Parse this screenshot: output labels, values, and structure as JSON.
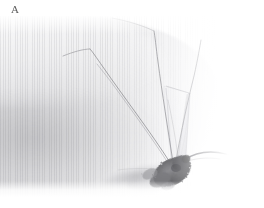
{
  "figure": {
    "panel_label": "A",
    "caption": "",
    "image_width": 264,
    "image_height": 208
  },
  "photo": {
    "alt": "Macro photograph of a mosquito resting on pale human skin",
    "background_color": "#ffffff",
    "skin_highlight_color": "#fbfbfc",
    "skin_midtone_color": "#e3e3e5",
    "skin_shadow_color": "#c4c4c6",
    "insect_body_color": "#6f6f71",
    "insect_leg_color": "#8a8a8e",
    "wing_color": "#dcdce0",
    "shadow_color": "#b9b9bd"
  },
  "anatomy": {
    "parts": [
      {
        "name": "body",
        "label": "abdomen-thorax"
      },
      {
        "name": "wing",
        "label": "wing"
      },
      {
        "name": "proboscis",
        "label": "proboscis"
      },
      {
        "name": "leg-1",
        "label": "foreleg"
      },
      {
        "name": "leg-2",
        "label": "midleg"
      },
      {
        "name": "leg-3",
        "label": "hindleg"
      },
      {
        "name": "leg-4",
        "label": "hindleg-upper"
      },
      {
        "name": "shadow",
        "label": "cast-shadow"
      }
    ]
  }
}
